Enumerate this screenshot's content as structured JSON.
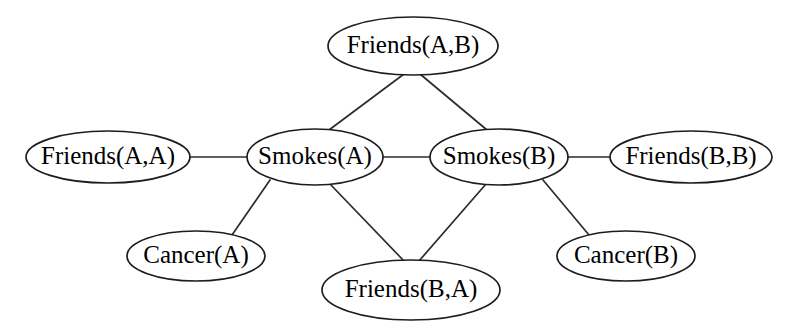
{
  "diagram": {
    "type": "undirected-graph",
    "background_color": "#ffffff",
    "node_fill": "#ffffff",
    "node_stroke": "#1d1d1d",
    "edge_color": "#2b2b2b",
    "label_color": "#000000",
    "nodes": [
      {
        "id": "friends_ab",
        "label": "Friends(A,B)",
        "cx": 413,
        "cy": 46,
        "rx": 85,
        "ry": 29
      },
      {
        "id": "friends_aa",
        "label": "Friends(A,A)",
        "cx": 108,
        "cy": 157,
        "rx": 82,
        "ry": 26
      },
      {
        "id": "smokes_a",
        "label": "Smokes(A)",
        "cx": 315,
        "cy": 157,
        "rx": 68,
        "ry": 28
      },
      {
        "id": "smokes_b",
        "label": "Smokes(B)",
        "cx": 499,
        "cy": 157,
        "rx": 69,
        "ry": 28
      },
      {
        "id": "friends_bb",
        "label": "Friends(B,B)",
        "cx": 691,
        "cy": 157,
        "rx": 81,
        "ry": 26
      },
      {
        "id": "cancer_a",
        "label": "Cancer(A)",
        "cx": 196,
        "cy": 256,
        "rx": 69,
        "ry": 25
      },
      {
        "id": "cancer_b",
        "label": "Cancer(B)",
        "cx": 626,
        "cy": 256,
        "rx": 69,
        "ry": 25
      },
      {
        "id": "friends_ba",
        "label": "Friends(B,A)",
        "cx": 411,
        "cy": 290,
        "rx": 89,
        "ry": 30
      }
    ],
    "edges": [
      {
        "id": "e1",
        "from": "friends_ab",
        "to": "smokes_a",
        "x1": 404,
        "y1": 74,
        "x2": 329,
        "y2": 130
      },
      {
        "id": "e2",
        "from": "friends_ab",
        "to": "smokes_b",
        "x1": 420,
        "y1": 74,
        "x2": 487,
        "y2": 130
      },
      {
        "id": "e3",
        "from": "friends_aa",
        "to": "smokes_a",
        "x1": 190,
        "y1": 157,
        "x2": 247,
        "y2": 157
      },
      {
        "id": "e4",
        "from": "smokes_a",
        "to": "smokes_b",
        "x1": 383,
        "y1": 157,
        "x2": 430,
        "y2": 157
      },
      {
        "id": "e5",
        "from": "smokes_b",
        "to": "friends_bb",
        "x1": 568,
        "y1": 157,
        "x2": 610,
        "y2": 157
      },
      {
        "id": "e6",
        "from": "smokes_a",
        "to": "cancer_a",
        "x1": 270,
        "y1": 180,
        "x2": 232,
        "y2": 235
      },
      {
        "id": "e7",
        "from": "smokes_b",
        "to": "cancer_b",
        "x1": 543,
        "y1": 180,
        "x2": 589,
        "y2": 235
      },
      {
        "id": "e8",
        "from": "smokes_a",
        "to": "friends_ba",
        "x1": 330,
        "y1": 184,
        "x2": 404,
        "y2": 261
      },
      {
        "id": "e9",
        "from": "smokes_b",
        "to": "friends_ba",
        "x1": 486,
        "y1": 184,
        "x2": 419,
        "y2": 261
      }
    ]
  }
}
